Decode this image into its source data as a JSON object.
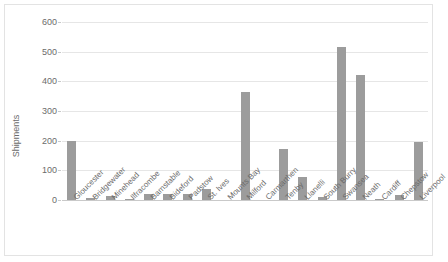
{
  "chart_data": {
    "type": "bar",
    "title": "",
    "xlabel": "",
    "ylabel": "Shipments",
    "ylim": [
      0,
      600
    ],
    "yticks": [
      0,
      100,
      200,
      300,
      400,
      500,
      600
    ],
    "grid": true,
    "legend": "none",
    "bar_color": "#9c9c9c",
    "gridline_color": "#e6e6e6",
    "categories": [
      "Gloucester",
      "Bridgewater",
      "Minehead",
      "Ilfracombe",
      "Barnstable",
      "Bideford",
      "Padstow",
      "St. Ives",
      "Mounts Bay",
      "Milford",
      "Carmarthen",
      "Tenby",
      "Llanelli",
      "South Burry",
      "Swansea",
      "Neath",
      "Cardiff",
      "Chepstow",
      "Liverpool"
    ],
    "values": [
      198,
      8,
      14,
      4,
      20,
      19,
      20,
      37,
      0,
      363,
      0,
      173,
      78,
      10,
      516,
      421,
      4,
      16,
      196
    ]
  }
}
